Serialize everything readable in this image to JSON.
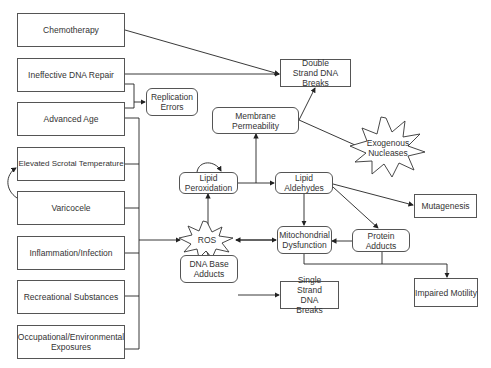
{
  "diagram": {
    "causes": [
      {
        "id": "chemotherapy",
        "label": "Chemotherapy"
      },
      {
        "id": "ineffective-dna-repair",
        "label": "Ineffective DNA Repair"
      },
      {
        "id": "advanced-age",
        "label": "Advanced Age"
      },
      {
        "id": "elevated-scrotal-temperature",
        "label": "Elevated Scrotal Temperature"
      },
      {
        "id": "varicocele",
        "label": "Varicocele"
      },
      {
        "id": "inflammation-infection",
        "label": "Inflammation/Infection"
      },
      {
        "id": "recreational-substances",
        "label": "Recreational Substances"
      },
      {
        "id": "occupational-environmental",
        "label": "Occupational/Environmental Exposures"
      }
    ],
    "nodes": {
      "replication_errors": "Replication Errors",
      "double_strand_breaks": "Double Strand DNA Breaks",
      "membrane_permeability": "Membrane Permeability",
      "exogenous_nucleases": "Exogenous Nucleases",
      "lipid_peroxidation": "Lipid Peroxidation",
      "lipid_aldehydes": "Lipid Aldehydes",
      "mutagenesis": "Mutagenesis",
      "ros": "ROS",
      "mitochondrial_dysfunction": "Mitochondrial Dysfunction",
      "protein_adducts": "Protein Adducts",
      "dna_base_adducts": "DNA Base Adducts",
      "single_strand_breaks": "Single Strand DNA Breaks",
      "impaired_motility": "Impaired Motility"
    },
    "edges": [
      [
        "Chemotherapy",
        "Double Strand DNA Breaks"
      ],
      [
        "Ineffective DNA Repair",
        "Double Strand DNA Breaks"
      ],
      [
        "Ineffective DNA Repair",
        "Replication Errors"
      ],
      [
        "Advanced Age",
        "Replication Errors"
      ],
      [
        "Advanced Age",
        "ROS"
      ],
      [
        "Elevated Scrotal Temperature",
        "ROS"
      ],
      [
        "Varicocele",
        "ROS"
      ],
      [
        "Varicocele",
        "Elevated Scrotal Temperature"
      ],
      [
        "Inflammation/Infection",
        "ROS"
      ],
      [
        "Recreational Substances",
        "ROS"
      ],
      [
        "Occupational/Environmental Exposures",
        "ROS"
      ],
      [
        "ROS",
        "Lipid Peroxidation"
      ],
      [
        "Lipid Peroxidation",
        "Lipid Peroxidation"
      ],
      [
        "Lipid Peroxidation",
        "Membrane Permeability"
      ],
      [
        "Lipid Peroxidation",
        "Lipid Aldehydes"
      ],
      [
        "Membrane Permeability",
        "Double Strand DNA Breaks"
      ],
      [
        "Membrane Permeability",
        "Exogenous Nucleases"
      ],
      [
        "Lipid Aldehydes",
        "Mitochondrial Dysfunction"
      ],
      [
        "Lipid Aldehydes",
        "Protein Adducts"
      ],
      [
        "Lipid Aldehydes",
        "Mutagenesis"
      ],
      [
        "Protein Adducts",
        "Mitochondrial Dysfunction"
      ],
      [
        "ROS",
        "Mitochondrial Dysfunction"
      ],
      [
        "Mitochondrial Dysfunction",
        "ROS"
      ],
      [
        "Mitochondrial Dysfunction",
        "Impaired Motility"
      ],
      [
        "Protein Adducts",
        "Impaired Motility"
      ],
      [
        "ROS",
        "DNA Base Adducts"
      ],
      [
        "DNA Base Adducts",
        "Single Strand DNA Breaks"
      ]
    ]
  }
}
